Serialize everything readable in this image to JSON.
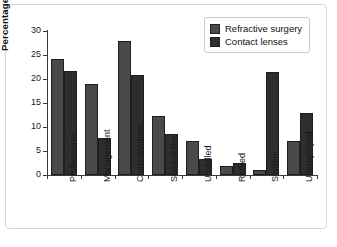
{
  "chart_data": {
    "type": "bar",
    "title": "",
    "xlabel": "",
    "ylabel": "Percentage",
    "ylim": [
      0,
      30
    ],
    "yticks": [
      0,
      5,
      10,
      15,
      20,
      25,
      30
    ],
    "grid": false,
    "legend_position": "top-right",
    "categories": [
      "Professional",
      "Management",
      "Clerical/Admin",
      "Semi-skilled",
      "Unskilled",
      "Retired",
      "Student",
      "Unemployed"
    ],
    "series": [
      {
        "name": "Refractive surgery",
        "color": "#4a4a4a",
        "values": [
          24.2,
          19.0,
          28.0,
          12.3,
          7.0,
          1.9,
          1.0,
          7.0
        ]
      },
      {
        "name": "Contact lenses",
        "color": "#2e2e2e",
        "values": [
          21.7,
          7.8,
          20.8,
          8.5,
          3.4,
          2.6,
          21.4,
          13.0
        ]
      }
    ]
  },
  "figure": {
    "background": "#ffffff",
    "border_color": "#d8d8d8"
  }
}
